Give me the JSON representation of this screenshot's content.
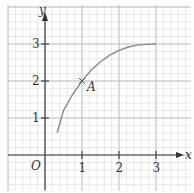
{
  "chart_data": {
    "type": "line",
    "title": "",
    "xlabel": "x",
    "ylabel": "y",
    "origin_label": "O",
    "x_ticks": [
      1,
      2,
      3
    ],
    "y_ticks": [
      1,
      2,
      3
    ],
    "x_tick_labels": [
      "1",
      "2",
      "3"
    ],
    "y_tick_labels": [
      "1",
      "2",
      "3"
    ],
    "xlim": [
      -1,
      3.7
    ],
    "ylim": [
      -1,
      4
    ],
    "grid": true,
    "series": [
      {
        "name": "curve",
        "x": [
          0.33,
          0.5,
          0.75,
          1.0,
          1.25,
          1.5,
          1.75,
          2.0,
          2.25,
          2.5,
          2.75,
          3.0
        ],
        "y": [
          0.6,
          1.2,
          1.65,
          2.0,
          2.3,
          2.52,
          2.7,
          2.83,
          2.92,
          2.97,
          2.99,
          3.0
        ]
      }
    ],
    "annotations": [
      {
        "label": "A",
        "x": 1,
        "y": 2,
        "marker": "cross"
      }
    ]
  },
  "colors": {
    "grid_minor": "#d8d8d8",
    "grid_major": "#b8b8b8",
    "axis": "#444444",
    "curve": "#888888"
  }
}
